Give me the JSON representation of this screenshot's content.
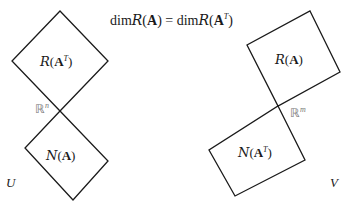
{
  "title": {
    "prefix1": "dim",
    "cal1": "R",
    "arg1": "A",
    "equals": "=",
    "prefix2": "dim",
    "cal2": "R",
    "arg2": "A",
    "sup2": "T"
  },
  "left": {
    "space_label": "U",
    "intersection": {
      "sym": "ℝ",
      "sup": "n"
    },
    "top_box": {
      "cal": "R",
      "arg": "A",
      "sup": "T"
    },
    "bottom_box": {
      "cal": "N",
      "arg": "A"
    }
  },
  "right": {
    "space_label": "V",
    "intersection": {
      "sym": "ℝ",
      "sup": "m"
    },
    "top_box": {
      "cal": "R",
      "arg": "A"
    },
    "bottom_box": {
      "cal": "N",
      "arg": "A",
      "sup": "T"
    }
  },
  "colors": {
    "stroke": "#1a1a1a",
    "gray_text": "#777777"
  }
}
